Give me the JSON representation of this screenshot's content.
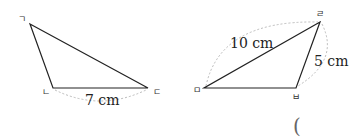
{
  "figure": {
    "triangle_left": {
      "vertices": [
        {
          "label": "ㄱ",
          "x": 30,
          "y": 24
        },
        {
          "label": "ㄴ",
          "x": 53,
          "y": 88
        },
        {
          "label": "ㄷ",
          "x": 148,
          "y": 88
        }
      ],
      "measurement": {
        "side": "ㄴㄷ",
        "text": "7 cm"
      }
    },
    "triangle_right": {
      "vertices": [
        {
          "label": "ㄹ",
          "x": 320,
          "y": 22
        },
        {
          "label": "ㅁ",
          "x": 204,
          "y": 88
        },
        {
          "label": "ㅂ",
          "x": 296,
          "y": 88
        }
      ],
      "measurements": [
        {
          "side": "ㄹㅁ",
          "text": "10 cm"
        },
        {
          "side": "ㄹㅂ",
          "text": "5 cm"
        }
      ]
    },
    "answer_paren": "("
  }
}
